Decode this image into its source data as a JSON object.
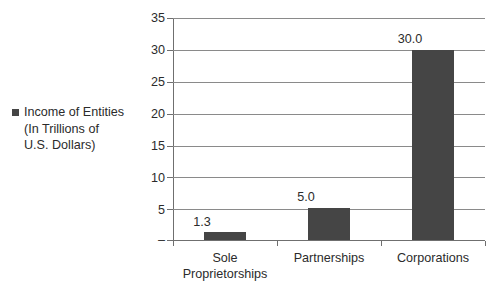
{
  "legend": {
    "marker_color": "#454545",
    "marker_icon": "legend-square-icon",
    "lines": [
      "Income of Entities",
      "(In Trillions of",
      "U.S. Dollars)"
    ]
  },
  "chart_data": {
    "type": "bar",
    "title": "",
    "subtitle": "",
    "xlabel": "",
    "ylabel": "",
    "categories": [
      "Sole Proprietorships",
      "Partnerships",
      "Corporations"
    ],
    "category_lines": [
      [
        "Sole",
        "Proprietorships"
      ],
      [
        "Partnerships"
      ],
      [
        "Corporations"
      ]
    ],
    "values": [
      1.3,
      5.0,
      30.0
    ],
    "value_labels": [
      "1.3",
      "5.0",
      "30.0"
    ],
    "series": [
      {
        "name": "Income of Entities (In Trillions of U.S. Dollars)",
        "values": [
          1.3,
          5.0,
          30.0
        ],
        "color": "#454545"
      }
    ],
    "ylim": [
      0,
      35
    ],
    "ytick_values": [
      0,
      5,
      10,
      15,
      20,
      25,
      30,
      35
    ],
    "ytick_labels": [
      "–",
      "5",
      "10",
      "15",
      "20",
      "25",
      "30",
      "35"
    ],
    "grid": true,
    "grid_axis": "y",
    "legend_position": "left",
    "bar_color": "#454545",
    "gridline_color": "#8a8a8a",
    "axis_color": "#6f6f6f"
  }
}
